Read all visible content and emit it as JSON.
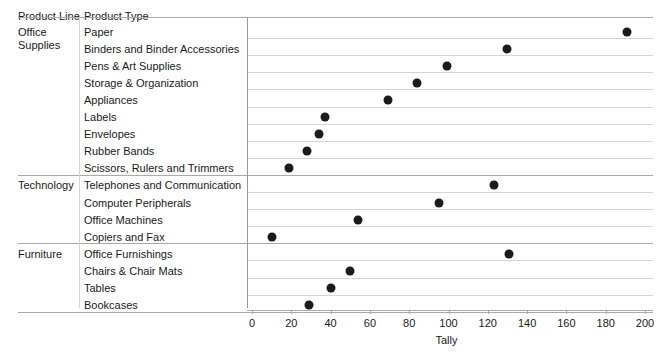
{
  "header": {
    "product_line_label": "Product Line",
    "product_type_label": "Product Type"
  },
  "axis": {
    "x_title": "Tally",
    "ticks": [
      "0",
      "20",
      "40",
      "60",
      "80",
      "100",
      "120",
      "140",
      "160",
      "180",
      "200"
    ]
  },
  "colors": {
    "dot": "#1b1b1b",
    "gridline": "#d6d6d6",
    "axis": "#a9a9a9",
    "text": "#1a1a1a"
  },
  "sections": [
    {
      "name": "Office Supplies",
      "rows": [
        {
          "type": "Paper",
          "value": 191
        },
        {
          "type": "Binders and Binder Accessories",
          "value": 130
        },
        {
          "type": "Pens & Art Supplies",
          "value": 99
        },
        {
          "type": "Storage & Organization",
          "value": 84
        },
        {
          "type": "Appliances",
          "value": 69
        },
        {
          "type": "Labels",
          "value": 37
        },
        {
          "type": "Envelopes",
          "value": 34
        },
        {
          "type": "Rubber Bands",
          "value": 28
        },
        {
          "type": "Scissors, Rulers and Trimmers",
          "value": 19
        }
      ]
    },
    {
      "name": "Technology",
      "rows": [
        {
          "type": "Telephones and Communication",
          "value": 123
        },
        {
          "type": "Computer Peripherals",
          "value": 95
        },
        {
          "type": "Office Machines",
          "value": 54
        },
        {
          "type": "Copiers and Fax",
          "value": 10
        }
      ]
    },
    {
      "name": "Furniture",
      "rows": [
        {
          "type": "Office Furnishings",
          "value": 131
        },
        {
          "type": "Chairs & Chair Mats",
          "value": 50
        },
        {
          "type": "Tables",
          "value": 40
        },
        {
          "type": "Bookcases",
          "value": 29
        }
      ]
    }
  ],
  "chart_data": {
    "type": "scatter",
    "title": "",
    "xlabel": "Tally",
    "ylabel": "",
    "xlim": [
      0,
      200
    ],
    "xticks": [
      0,
      20,
      40,
      60,
      80,
      100,
      120,
      140,
      160,
      180,
      200
    ],
    "grid": true,
    "legend": "none",
    "orientation": "horizontal-dot-plot",
    "group_field": "Product Line",
    "category_field": "Product Type",
    "value_field": "Tally",
    "categories": [
      "Paper",
      "Binders and Binder Accessories",
      "Pens & Art Supplies",
      "Storage & Organization",
      "Appliances",
      "Labels",
      "Envelopes",
      "Rubber Bands",
      "Scissors, Rulers and Trimmers",
      "Telephones and Communication",
      "Computer Peripherals",
      "Office Machines",
      "Copiers and Fax",
      "Office Furnishings",
      "Chairs & Chair Mats",
      "Tables",
      "Bookcases"
    ],
    "values": [
      191,
      130,
      99,
      84,
      69,
      37,
      34,
      28,
      19,
      123,
      95,
      54,
      10,
      131,
      50,
      40,
      29
    ],
    "groups": [
      "Office Supplies",
      "Office Supplies",
      "Office Supplies",
      "Office Supplies",
      "Office Supplies",
      "Office Supplies",
      "Office Supplies",
      "Office Supplies",
      "Office Supplies",
      "Technology",
      "Technology",
      "Technology",
      "Technology",
      "Furniture",
      "Furniture",
      "Furniture",
      "Furniture"
    ]
  }
}
